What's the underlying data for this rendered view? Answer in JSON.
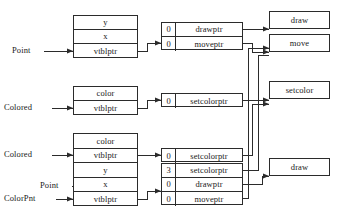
{
  "diagram": {
    "stroke_color": "#2b2b2b",
    "background": "#ffffff",
    "labels": [
      {
        "name": "pointer-label-point-top",
        "text": "Point"
      },
      {
        "name": "pointer-label-colored-mid",
        "text": "Colored"
      },
      {
        "name": "pointer-label-colored-bottom",
        "text": "Colored"
      },
      {
        "name": "pointer-label-point-bottom",
        "text": "Point"
      },
      {
        "name": "pointer-label-colorpnt",
        "text": "ColorPnt"
      }
    ],
    "objects": [
      {
        "name": "point-object",
        "fields": [
          {
            "text": "y"
          },
          {
            "text": "x"
          },
          {
            "text": "vtblptr"
          }
        ]
      },
      {
        "name": "colored-object",
        "fields": [
          {
            "text": "color"
          },
          {
            "text": "vtblptr"
          }
        ]
      },
      {
        "name": "colorpnt-object",
        "fields": [
          {
            "text": "color"
          },
          {
            "text": "vtblptr"
          },
          {
            "text": "y"
          },
          {
            "text": "x"
          },
          {
            "text": "vtblptr"
          }
        ]
      }
    ],
    "vtables": [
      {
        "name": "point-vtable",
        "entries": [
          {
            "offset": "0",
            "slot": "drawptr"
          },
          {
            "offset": "0",
            "slot": "moveptr"
          }
        ]
      },
      {
        "name": "colored-vtable",
        "entries": [
          {
            "offset": "0",
            "slot": "setcolorptr"
          }
        ]
      },
      {
        "name": "colorpnt-colored-vtable",
        "entries": [
          {
            "offset": "0",
            "slot": "setcolorptr"
          }
        ]
      },
      {
        "name": "colorpnt-point-vtable",
        "entries": [
          {
            "offset": "3",
            "slot": "setcolorptr"
          },
          {
            "offset": "0",
            "slot": "drawptr"
          },
          {
            "offset": "0",
            "slot": "moveptr"
          }
        ]
      }
    ],
    "functions": [
      {
        "name": "function-draw-top",
        "text": "draw"
      },
      {
        "name": "function-move",
        "text": "move"
      },
      {
        "name": "function-setcolor",
        "text": "setcolor"
      },
      {
        "name": "function-draw-bottom",
        "text": "draw"
      }
    ]
  }
}
